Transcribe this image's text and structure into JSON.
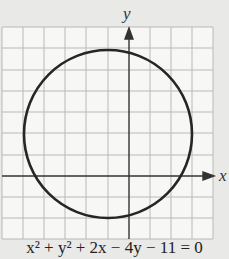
{
  "diagram": {
    "type": "circle-graph",
    "equation": "x² + y² + 2x − 4y − 11 = 0",
    "x_axis_label": "x",
    "y_axis_label": "y",
    "center": [
      -1,
      2
    ],
    "radius": 4,
    "grid": {
      "x_range": [
        -6,
        4
      ],
      "y_range": [
        -3,
        7
      ],
      "step": 1
    },
    "colors": {
      "background": "#e9e9e7",
      "grid_bg": "#f7f7f5",
      "grid_line": "#b9b9b7",
      "axis": "#333333",
      "curve": "#262626"
    }
  }
}
